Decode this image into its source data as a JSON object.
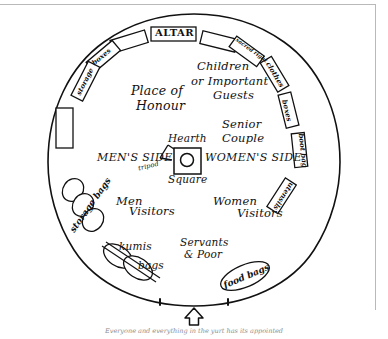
{
  "diagram": {
    "caption": "Everyone and everything in the yurt has its appointed",
    "entrance_icon": "up-arrow-icon"
  },
  "zones": {
    "altar": "ALTAR",
    "place_of_honour_l1": "Place of",
    "place_of_honour_l2": "Honour",
    "children_l1": "Children",
    "children_l2": "or Important",
    "children_l3": "Guests",
    "senior_l1": "Senior",
    "senior_l2": "Couple",
    "mens_side": "MEN'S SIDE",
    "womens_side": "WOMEN'S SIDE",
    "hearth": "Hearth",
    "square": "Square",
    "tripod": "tripod",
    "men_l1": "Men",
    "men_l2": "Visitors",
    "women_l1": "Women",
    "women_l2": "Visitors",
    "servants_l1": "Servants",
    "servants_l2": "& Poor"
  },
  "storage": {
    "left_storage": "storage",
    "left_boxes": "boxes",
    "sacred_right": "sacred right",
    "clothes": "clothes",
    "right_boxes": "boxes",
    "boot_bag": "boot bag",
    "utensils": "utensils",
    "food_bags": "food bags",
    "storage_bags": "storage bags",
    "kumis": "kumis",
    "bags": "bags"
  },
  "colors": {
    "ink": "#111111",
    "rule": "#b9b9b9",
    "caption": "#8e8e8e",
    "paper": "#ffffff"
  }
}
